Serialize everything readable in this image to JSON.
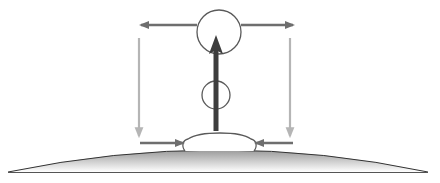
{
  "diagram": {
    "title": "",
    "type": "physics-schematic",
    "colors": {
      "background": "#ffffff",
      "main_arrow": "#3d3d3d",
      "flow_arrows": "#6e6e6e",
      "return_arrows": "#b5b5b5",
      "circle_stroke": "#5a5a5a",
      "ground_top": "#9a9a9a",
      "ground_bottom": "#ffffff",
      "ground_outline": "#333333"
    },
    "elements": {
      "large_circle": {
        "cx": 219,
        "cy": 32,
        "r": 22
      },
      "small_circle": {
        "cx": 216,
        "cy": 95,
        "r": 14
      },
      "main_arrow": {
        "x": 216,
        "y_start": 131,
        "y_end": 38,
        "direction": "up"
      },
      "top_left_arrow": {
        "y": 25,
        "x_start": 197,
        "x_end": 139,
        "direction": "left"
      },
      "top_right_arrow": {
        "y": 25,
        "x_start": 241,
        "x_end": 294,
        "direction": "right"
      },
      "left_return_arrow": {
        "x": 139,
        "y_start": 38,
        "y_end": 138,
        "direction": "down"
      },
      "right_return_arrow": {
        "x": 290,
        "y_start": 38,
        "y_end": 138,
        "direction": "down"
      },
      "bottom_left_inflow": {
        "y": 143,
        "x_start": 140,
        "x_end": 184,
        "direction": "right"
      },
      "bottom_right_inflow": {
        "y": 143,
        "x_start": 293,
        "x_end": 254,
        "direction": "left"
      },
      "dome": {
        "x_left": 183,
        "x_right": 256,
        "top": 133,
        "base": 153
      },
      "ground": {
        "x_left": 8,
        "x_right": 428,
        "crest": 150,
        "base": 173
      }
    }
  }
}
